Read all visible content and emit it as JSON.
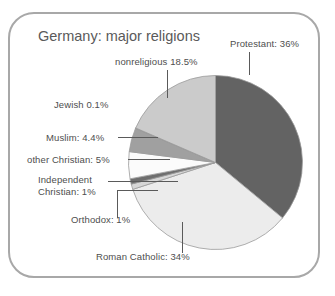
{
  "chart_data": {
    "type": "pie",
    "title": "Germany: major religions",
    "xlabel": "",
    "ylabel": "",
    "legend_position": "none",
    "grid": false,
    "unit": "percent",
    "categories": [
      "Protestant",
      "Roman Catholic",
      "Orthodox",
      "Independent Christian",
      "other Christian",
      "Muslim",
      "Jewish",
      "nonreligious"
    ],
    "values": [
      36,
      34,
      1,
      1,
      5,
      4.4,
      0.1,
      18.5
    ],
    "labels": [
      "Protestant: 36%",
      "Roman Catholic: 34%",
      "Orthodox: 1%",
      "Independent Christian: 1%",
      "other Christian: 5%",
      "Muslim: 4.4%",
      "Jewish 0.1%",
      "nonreligious 18.5%"
    ],
    "slice_colors": [
      "#636363",
      "#ececec",
      "#d6d6d6",
      "#6e6e6e",
      "#fbfbfb",
      "#a0a0a0",
      "#888888",
      "#cbcbcb"
    ],
    "start_angle_deg": 0,
    "direction": "clockwise"
  },
  "labels": {
    "protestant": "Protestant: 36%",
    "nonreligious": "nonreligious 18.5%",
    "jewish": "Jewish 0.1%",
    "muslim": "Muslim: 4.4%",
    "other_christian": "other Christian: 5%",
    "independent_christian_line1": "Independent",
    "independent_christian_line2": "Christian: 1%",
    "orthodox": "Orthodox: 1%",
    "roman_catholic": "Roman Catholic: 34%"
  },
  "colors": {
    "frame_border": "#a8a8a8",
    "pie_outline": "#9a9a9a",
    "leader_line": "#5a5a5a",
    "text": "#4e4e4e",
    "background": "#ffffff"
  }
}
